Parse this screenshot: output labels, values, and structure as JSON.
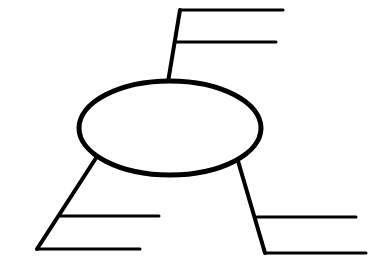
{
  "diagram": {
    "type": "blank-mind-map-organizer",
    "stroke_color": "#000000",
    "background": "#ffffff",
    "center_node": {
      "shape": "ellipse",
      "label": "",
      "cx": 170,
      "cy": 128,
      "rx": 91,
      "ry": 47,
      "stroke_width": 5
    },
    "branches": [
      {
        "id": "top",
        "stem": {
          "x1": 168,
          "y1": 82,
          "x2": 180,
          "y2": 10,
          "stroke_width": 4
        },
        "lines": [
          {
            "x1": 180,
            "y1": 10,
            "x2": 283,
            "y2": 10,
            "label": ""
          },
          {
            "x1": 176,
            "y1": 42,
            "x2": 276,
            "y2": 42,
            "label": ""
          }
        ]
      },
      {
        "id": "bottom-left",
        "stem": {
          "x1": 96,
          "y1": 158,
          "x2": 37,
          "y2": 249,
          "stroke_width": 4
        },
        "lines": [
          {
            "x1": 60,
            "y1": 216,
            "x2": 159,
            "y2": 216,
            "label": ""
          },
          {
            "x1": 37,
            "y1": 249,
            "x2": 140,
            "y2": 249,
            "label": ""
          }
        ]
      },
      {
        "id": "bottom-right",
        "stem": {
          "x1": 238,
          "y1": 161,
          "x2": 265,
          "y2": 253,
          "stroke_width": 4
        },
        "lines": [
          {
            "x1": 257,
            "y1": 217,
            "x2": 356,
            "y2": 217,
            "label": ""
          },
          {
            "x1": 265,
            "y1": 253,
            "x2": 366,
            "y2": 253,
            "label": ""
          }
        ]
      }
    ]
  }
}
